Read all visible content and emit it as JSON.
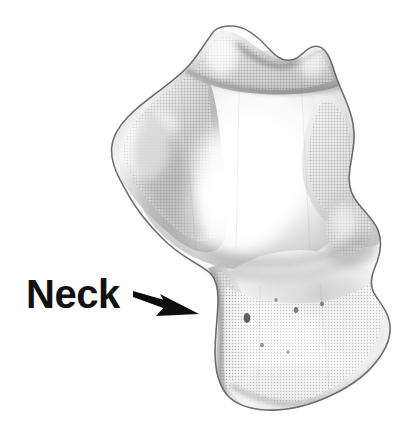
{
  "figure": {
    "type": "anatomical-specimen-photograph",
    "background_color": "#ffffff",
    "width": 418,
    "height": 428,
    "rendering": "grayscale halftone print"
  },
  "annotations": [
    {
      "id": "neck",
      "label": "Neck",
      "color": "#111111",
      "font_size_px": 40,
      "bold": true,
      "x": 26,
      "y": 274,
      "pointer": {
        "icon": "arrow-right-icon",
        "color": "#0d0d0d",
        "tail_x": 133,
        "tail_y": 291,
        "tip_x": 199,
        "tip_y": 314
      }
    }
  ],
  "specimen": {
    "outline_color": "#6a6a6a",
    "fill_light": "#fdfdfd",
    "fill_mid": "#d8d8d8",
    "fill_shadow": "#a9a9a9",
    "fill_dark": "#8a8a8a",
    "regions": [
      {
        "name": "superior-process-left",
        "tone": "light"
      },
      {
        "name": "superior-process-right",
        "tone": "light"
      },
      {
        "name": "body-upper",
        "tone": "mid"
      },
      {
        "name": "lateral-tubercle-left",
        "tone": "shadow"
      },
      {
        "name": "lateral-condyle-right",
        "tone": "shadow"
      },
      {
        "name": "neck-constriction",
        "tone": "mid"
      },
      {
        "name": "body-lower",
        "tone": "light"
      },
      {
        "name": "inferior-margin",
        "tone": "shadow"
      }
    ]
  }
}
